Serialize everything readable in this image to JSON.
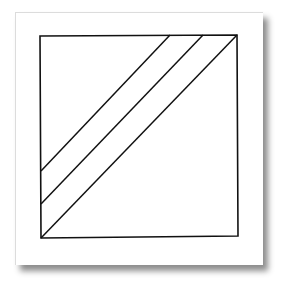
{
  "figure": {
    "stroke_color": "#111111",
    "paper_color": "#ffffff",
    "square": {
      "corners": [
        [
          40,
          36
        ],
        [
          237,
          35
        ],
        [
          238,
          236
        ],
        [
          41,
          238
        ]
      ]
    },
    "diagonals": [
      {
        "x1": 170,
        "y1": 35,
        "x2": 41,
        "y2": 171
      },
      {
        "x1": 203,
        "y1": 35,
        "x2": 41,
        "y2": 204
      },
      {
        "x1": 237,
        "y1": 35,
        "x2": 41,
        "y2": 238
      }
    ]
  }
}
